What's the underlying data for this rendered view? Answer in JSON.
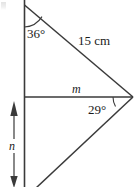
{
  "figure": {
    "type": "geometry-diagram",
    "width": 139,
    "height": 187,
    "background_color": "#ffffff",
    "stroke_color": "#333333"
  },
  "labels": {
    "angle_top": "36°",
    "angle_right": "29°",
    "side_hypotenuse": "15 cm",
    "segment_horizontal": "m",
    "segment_vertical": "n"
  },
  "geometry": {
    "vertical_line": {
      "x": 24.5,
      "y1": 0,
      "y2": 187
    },
    "top_vertex": {
      "x": 24.5,
      "y": 5
    },
    "right_vertex": {
      "x": 133,
      "y": 97
    },
    "left_mid_vertex": {
      "x": 24.5,
      "y": 97
    },
    "bottom_exit": {
      "x": 40,
      "y": 187
    },
    "hypotenuse": {
      "x1": 24.5,
      "y1": 5,
      "x2": 133,
      "y2": 97
    },
    "horizontal_segment": {
      "x1": 24.5,
      "y1": 97,
      "x2": 133,
      "y2": 97
    },
    "lower_diagonal": {
      "x1": 133,
      "y1": 97,
      "x2": 37,
      "y2": 187
    },
    "angle_arc_top": {
      "cx": 24.5,
      "cy": 5,
      "radius": 22
    },
    "angle_arc_right": {
      "cx": 133,
      "cy": 97,
      "radius": 20
    },
    "measure_arrow": {
      "x": 14,
      "y_top": 103,
      "y_bottom": 186
    }
  },
  "icons": {
    "arrow_up": "arrow-up-head",
    "arrow_down": "arrow-down-head"
  }
}
